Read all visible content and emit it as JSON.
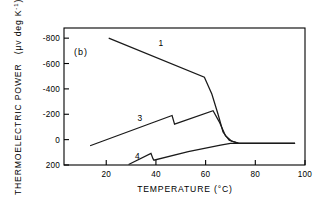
{
  "figure": {
    "panel_label": "(b)",
    "background": "#ffffff",
    "ink_color": "#1a1a1a"
  },
  "chart_data": {
    "type": "line",
    "title": "",
    "xlabel": "TEMPERATURE  (°C)",
    "ylabel_main": "THERMOELECTRIC POWER",
    "ylabel_units_pre": "(μv deg K",
    "ylabel_units_sup": "-1",
    "ylabel_units_post": ")",
    "xlim": [
      3,
      100
    ],
    "ylim": [
      -880,
      200
    ],
    "y_inverted": true,
    "grid": false,
    "legend": "inline-curve-numbers",
    "xticks": [
      20,
      40,
      60,
      80,
      100
    ],
    "xticklabels": [
      "20",
      "40",
      "60",
      "80",
      "100"
    ],
    "yticks": [
      -800,
      -600,
      -400,
      -200,
      0,
      200
    ],
    "yticklabels": [
      "-800",
      "-600",
      "-400",
      "-200",
      "0",
      "200"
    ],
    "series": [
      {
        "name": "1",
        "label": "1",
        "label_x": 42,
        "label_y": -735,
        "points": [
          [
            21,
            -800
          ],
          [
            59.5,
            -492
          ],
          [
            62.5,
            -360
          ],
          [
            65,
            -200
          ],
          [
            67,
            -60
          ],
          [
            69.5,
            5
          ],
          [
            73,
            28
          ],
          [
            77,
            30
          ],
          [
            96,
            30
          ]
        ]
      },
      {
        "name": "3",
        "label": "3",
        "label_x": 33.5,
        "label_y": -150,
        "points": [
          [
            13.5,
            48
          ],
          [
            46.5,
            -190
          ],
          [
            47.5,
            -122
          ],
          [
            63,
            -228
          ],
          [
            65.5,
            -140
          ],
          [
            68,
            -30
          ],
          [
            70.5,
            12
          ],
          [
            73.5,
            30
          ],
          [
            80,
            30
          ],
          [
            96,
            30
          ]
        ]
      },
      {
        "name": "4",
        "label": "4",
        "label_x": 32.5,
        "label_y": 150,
        "points": [
          [
            29,
            196
          ],
          [
            38,
            108
          ],
          [
            38.8,
            150
          ],
          [
            39.2,
            162
          ],
          [
            53,
            95
          ],
          [
            66,
            44
          ],
          [
            70,
            30
          ],
          [
            76,
            29
          ],
          [
            96,
            29
          ]
        ]
      }
    ]
  }
}
